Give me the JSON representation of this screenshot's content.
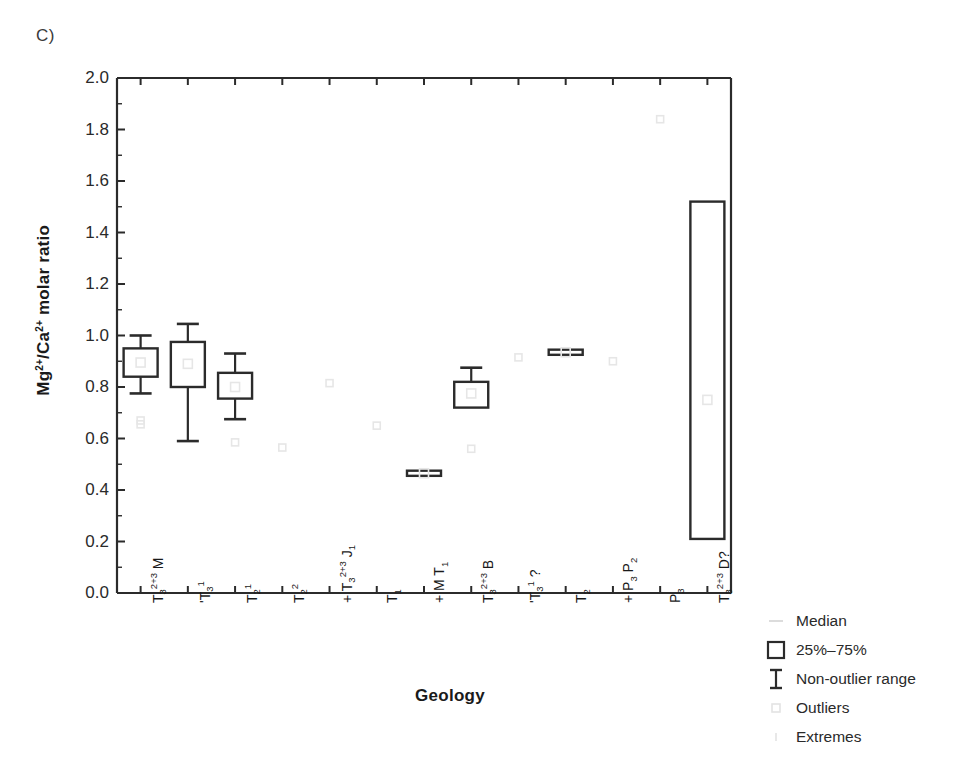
{
  "panel": {
    "label": "C)"
  },
  "chart_data": {
    "type": "box",
    "title": "",
    "xlabel": "Geology",
    "ylabel": "Mg2+/Ca2+ molar ratio",
    "ylim": [
      0.0,
      2.0
    ],
    "ytick_labels": [
      "0.0",
      "0.2",
      "0.4",
      "0.6",
      "0.8",
      "1.0",
      "1.2",
      "1.4",
      "1.6",
      "1.8",
      "2.0"
    ],
    "ytick_values": [
      0.0,
      0.2,
      0.4,
      0.6,
      0.8,
      1.0,
      1.2,
      1.4,
      1.6,
      1.8,
      2.0
    ],
    "grid": false,
    "legend_position": "right-bottom-outside",
    "categories": [
      "T3^2+3 M",
      "'T3^1",
      "T2^1",
      "T2^2",
      "J1 + T3^2+3",
      "T1",
      "T1 + M",
      "T3^2+3 B",
      "'T3^1 ?",
      "T2",
      "P2 + P3",
      "P3",
      "T3^2+3 D?"
    ],
    "boxes": [
      {
        "category": "T3^2+3 M",
        "q1": 0.84,
        "q3": 0.95,
        "median": 0.895,
        "whisker_low": 0.775,
        "whisker_high": 1.0,
        "outliers": [
          0.67,
          0.655
        ],
        "extremes": []
      },
      {
        "category": "'T3^1",
        "q1": 0.8,
        "q3": 0.975,
        "median": 0.89,
        "whisker_low": 0.59,
        "whisker_high": 1.045,
        "outliers": [],
        "extremes": []
      },
      {
        "category": "T2^1",
        "q1": 0.755,
        "q3": 0.855,
        "median": 0.8,
        "whisker_low": 0.675,
        "whisker_high": 0.93,
        "outliers": [
          0.585
        ],
        "extremes": []
      },
      {
        "category": "T2^2",
        "q1": null,
        "q3": null,
        "median": 0.565,
        "whisker_low": null,
        "whisker_high": null,
        "outliers": [
          0.565
        ],
        "extremes": []
      },
      {
        "category": "J1 + T3^2+3",
        "q1": null,
        "q3": null,
        "median": 0.815,
        "whisker_low": null,
        "whisker_high": null,
        "outliers": [
          0.815
        ],
        "extremes": []
      },
      {
        "category": "T1",
        "q1": null,
        "q3": null,
        "median": 0.65,
        "whisker_low": null,
        "whisker_high": null,
        "outliers": [
          0.65
        ],
        "extremes": []
      },
      {
        "category": "T1 + M",
        "q1": 0.455,
        "q3": 0.475,
        "median": 0.465,
        "whisker_low": null,
        "whisker_high": null,
        "outliers": [],
        "extremes": []
      },
      {
        "category": "T3^2+3 B",
        "q1": 0.72,
        "q3": 0.82,
        "median": 0.775,
        "whisker_low": null,
        "whisker_high": 0.875,
        "outliers": [
          0.56
        ],
        "extremes": []
      },
      {
        "category": "'T3^1 ?",
        "q1": null,
        "q3": null,
        "median": 0.915,
        "whisker_low": null,
        "whisker_high": null,
        "outliers": [
          0.915
        ],
        "extremes": []
      },
      {
        "category": "T2",
        "q1": 0.925,
        "q3": 0.945,
        "median": 0.935,
        "whisker_low": null,
        "whisker_high": null,
        "outliers": [],
        "extremes": []
      },
      {
        "category": "P2 + P3",
        "q1": null,
        "q3": null,
        "median": 0.9,
        "whisker_low": null,
        "whisker_high": null,
        "outliers": [
          0.9
        ],
        "extremes": []
      },
      {
        "category": "P3",
        "q1": null,
        "q3": null,
        "median": 1.84,
        "whisker_low": null,
        "whisker_high": null,
        "outliers": [
          1.84
        ],
        "extremes": []
      },
      {
        "category": "T3^2+3 D?",
        "q1": 0.21,
        "q3": 1.52,
        "median": 0.75,
        "whisker_low": null,
        "whisker_high": null,
        "outliers": [],
        "extremes": []
      }
    ],
    "legend": [
      {
        "symbol": "median-dash",
        "label": "Median"
      },
      {
        "symbol": "box-rect",
        "label": "25%–75%"
      },
      {
        "symbol": "whisker-bar",
        "label": "Non-outlier range"
      },
      {
        "symbol": "outlier-square",
        "label": "Outliers"
      },
      {
        "symbol": "extreme-tick",
        "label": "Extremes"
      }
    ],
    "colors": {
      "line": "#2b2b2b",
      "outlier": "#e6e6e6",
      "background": "#ffffff"
    }
  },
  "xtick_labels": [
    {
      "main": "M",
      "pre": "T",
      "sub": "3",
      "sup": "2+3",
      "second": ""
    },
    {
      "main": "",
      "pre": "'T",
      "sub": "3",
      "sup": "1",
      "second": ""
    },
    {
      "main": "",
      "pre": "T",
      "sub": "2",
      "sup": "1",
      "second": ""
    },
    {
      "main": "",
      "pre": "T",
      "sub": "2",
      "sup": "2",
      "second": ""
    },
    {
      "main": "",
      "pre": "J",
      "sub": "1",
      "sup": "",
      "second": "+ T3 2+3"
    },
    {
      "main": "",
      "pre": "T",
      "sub": "1",
      "sup": "",
      "second": ""
    },
    {
      "main": "",
      "pre": "T",
      "sub": "1",
      "sup": "",
      "second": "+ M"
    },
    {
      "main": "B",
      "pre": "T",
      "sub": "3",
      "sup": "2+3",
      "second": ""
    },
    {
      "main": "?",
      "pre": "'T",
      "sub": "3",
      "sup": "1",
      "second": ""
    },
    {
      "main": "",
      "pre": "T",
      "sub": "2",
      "sup": "",
      "second": ""
    },
    {
      "main": "",
      "pre": "P",
      "sub": "2",
      "sup": "",
      "second": "+ P3"
    },
    {
      "main": "",
      "pre": "P",
      "sub": "3",
      "sup": "",
      "second": ""
    },
    {
      "main": "D?",
      "pre": "T",
      "sub": "3",
      "sup": "2+3",
      "second": ""
    }
  ]
}
